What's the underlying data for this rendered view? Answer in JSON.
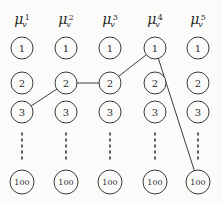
{
  "figure": {
    "kind": "trellis-lattice-diagram",
    "background_color": "#fbfbfa",
    "stroke_color": "#3a3a3a",
    "text_color": "#2b2b2b"
  },
  "columns": [
    {
      "id": "col1",
      "mu": "μ",
      "subscript": "v",
      "superscript": "1",
      "cx": 22
    },
    {
      "id": "col2",
      "mu": "μ",
      "subscript": "v",
      "superscript": "2",
      "cx": 66
    },
    {
      "id": "col3",
      "mu": "μ",
      "subscript": "v",
      "superscript": "3",
      "cx": 110
    },
    {
      "id": "col4",
      "mu": "μ",
      "subscript": "v",
      "superscript": "4",
      "cx": 155
    },
    {
      "id": "col5",
      "mu": "μ",
      "subscript": "v",
      "superscript": "5",
      "cx": 198
    }
  ],
  "header_y": 20,
  "rows": [
    {
      "id": "row1",
      "label": "1",
      "cy": 48,
      "r": 11
    },
    {
      "id": "row2",
      "label": "2",
      "cy": 83,
      "r": 11
    },
    {
      "id": "row3",
      "label": "3",
      "cy": 112,
      "r": 11
    },
    {
      "id": "row100",
      "label": "100",
      "cy": 182,
      "r": 12
    }
  ],
  "ellipsis": {
    "label": "vertical-dots",
    "y_start": 133,
    "y_end": 163,
    "dash": "2,4"
  },
  "path": {
    "label": "selected-path",
    "nodes": [
      {
        "column": "col1",
        "row": "row3"
      },
      {
        "column": "col2",
        "row": "row2"
      },
      {
        "column": "col3",
        "row": "row2"
      },
      {
        "column": "col4",
        "row": "row1"
      },
      {
        "column": "col5",
        "row": "row100"
      }
    ]
  }
}
